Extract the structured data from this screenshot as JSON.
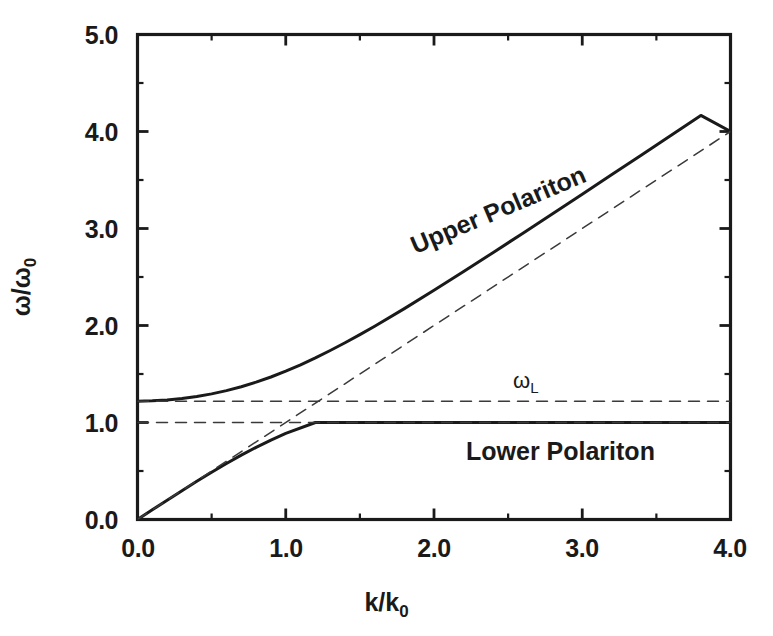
{
  "figure": {
    "background": "#ffffff",
    "ink_color": "#1a1a1a",
    "width": 773,
    "height": 636
  },
  "axes": {
    "x_title_main": "k/k",
    "x_title_sub": "0",
    "y_title_main": "ω/ω",
    "y_title_sub": "0",
    "x_ticks": [
      "0.0",
      "1.0",
      "2.0",
      "3.0",
      "4.0"
    ],
    "y_ticks": [
      "0.0",
      "1.0",
      "2.0",
      "3.0",
      "4.0",
      "5.0"
    ]
  },
  "annotations": {
    "upper_branch": "Upper Polariton",
    "lower_branch": "Lower Polariton",
    "omega_l_main": "ω",
    "omega_l_sub": "L"
  },
  "chart_data": {
    "type": "line",
    "title": "",
    "xlabel": "k/k₀",
    "ylabel": "ω/ω₀",
    "xlim": [
      0.0,
      4.0
    ],
    "ylim": [
      0.0,
      5.0
    ],
    "xticks": [
      0.0,
      1.0,
      2.0,
      3.0,
      4.0
    ],
    "yticks": [
      0.0,
      1.0,
      2.0,
      3.0,
      4.0,
      5.0
    ],
    "x_minor_tick_step": 0.5,
    "y_minor_tick_step": 0.5,
    "grid": false,
    "legend": "none",
    "annotations": [
      {
        "text": "Upper Polariton",
        "x": 1.9,
        "y": 2.65,
        "rotation": -23
      },
      {
        "text": "Lower Polariton",
        "x": 2.2,
        "y": 0.77,
        "rotation": 0
      },
      {
        "text": "ωL",
        "x": 2.55,
        "y": 1.29,
        "rotation": 0
      }
    ],
    "constants": {
      "omega_L_over_omega_0": 1.22,
      "omega_T_over_omega_0": 1.0,
      "light_line_slope": 1.0
    },
    "series": [
      {
        "name": "Upper Polariton",
        "style": "solid",
        "linewidth": 3,
        "color": "#1a1a1a",
        "x": [
          0.0,
          0.1,
          0.2,
          0.3,
          0.4,
          0.5,
          0.6,
          0.7,
          0.8,
          0.9,
          1.0,
          1.1,
          1.2,
          1.3,
          1.4,
          1.5,
          1.6,
          1.8,
          2.0,
          2.2,
          2.4,
          2.6,
          2.8,
          3.0,
          3.2,
          3.4,
          3.6,
          3.8,
          4.0
        ],
        "y": [
          1.22,
          1.223,
          1.232,
          1.247,
          1.268,
          1.295,
          1.329,
          1.369,
          1.416,
          1.469,
          1.529,
          1.595,
          1.666,
          1.742,
          1.822,
          1.906,
          1.993,
          2.174,
          2.363,
          2.556,
          2.753,
          2.952,
          3.152,
          3.354,
          3.556,
          3.759,
          3.962,
          4.166,
          4.0
        ]
      },
      {
        "name": "Lower Polariton",
        "style": "solid",
        "linewidth": 3,
        "color": "#1a1a1a",
        "x": [
          0.0,
          0.1,
          0.2,
          0.3,
          0.4,
          0.5,
          0.6,
          0.7,
          0.8,
          0.9,
          1.0,
          1.2,
          1.4,
          1.6,
          1.8,
          2.0,
          2.2,
          2.4,
          2.6,
          2.8,
          3.0,
          3.2,
          3.4,
          3.6,
          3.8,
          4.0
        ],
        "y": [
          0.0,
          0.0999,
          0.1993,
          0.2975,
          0.3938,
          0.4874,
          0.5775,
          0.6633,
          0.7441,
          0.8192,
          0.8881,
          1.0,
          1.0,
          1.0,
          1.0,
          1.0,
          1.0,
          1.0,
          1.0,
          1.0,
          1.0,
          1.0,
          1.0,
          1.0,
          1.0,
          1.0
        ]
      },
      {
        "name": "Light line",
        "style": "dashed",
        "linewidth": 1.5,
        "color": "#3a3a3a",
        "x": [
          0.0,
          4.0
        ],
        "y": [
          0.0,
          4.0
        ]
      },
      {
        "name": "omega_L asymptote",
        "style": "dashed",
        "linewidth": 1.5,
        "color": "#3a3a3a",
        "x": [
          0.0,
          4.0
        ],
        "y": [
          1.22,
          1.22
        ]
      },
      {
        "name": "omega_T asymptote",
        "style": "dashed",
        "linewidth": 1.5,
        "color": "#3a3a3a",
        "x": [
          0.0,
          4.0
        ],
        "y": [
          1.0,
          1.0
        ]
      }
    ]
  }
}
